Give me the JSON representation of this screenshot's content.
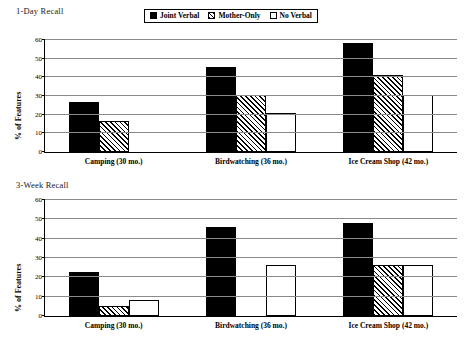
{
  "legend": {
    "items": [
      {
        "label": "Joint Verbal",
        "style": "solid",
        "icon": "solid-square-swatch-icon"
      },
      {
        "label": "Mother-Only",
        "style": "hatch",
        "icon": "hatched-square-swatch-icon"
      },
      {
        "label": "No Verbal",
        "style": "open",
        "icon": "open-square-swatch-icon"
      }
    ]
  },
  "panels": [
    {
      "title": "1-Day Recall",
      "ylabel": "% of Features",
      "yticks": [
        "0",
        "10",
        "20",
        "30",
        "40",
        "50",
        "60"
      ],
      "categories": [
        "Camping (30 mo.)",
        "Birdwatching (36 mo.)",
        "Ice Cream Shop (42 mo.)"
      ],
      "values": {
        "Joint Verbal": [
          27,
          45.5,
          58.5
        ],
        "Mother-Only": [
          16.5,
          30.5,
          41
        ],
        "No Verbal": [
          0,
          21,
          30.5
        ]
      }
    },
    {
      "title": "3-Week Recall",
      "ylabel": "% of Features",
      "yticks": [
        "0",
        "10",
        "20",
        "30",
        "40",
        "50",
        "60"
      ],
      "categories": [
        "Camping (30 mo.)",
        "Birdwatching (36 mo.)",
        "Ice Cream Shop (42 mo.)"
      ],
      "values": {
        "Joint Verbal": [
          23,
          46,
          48
        ],
        "Mother-Only": [
          5,
          0,
          26.5
        ],
        "No Verbal": [
          8.5,
          26.5,
          26.5
        ]
      }
    }
  ],
  "chart_data": [
    {
      "type": "bar",
      "title": "1-Day Recall",
      "xlabel": "",
      "ylabel": "% of Features",
      "ylim": [
        0,
        60
      ],
      "ytick_step": 10,
      "grid": true,
      "legend_position": "top-center",
      "categories": [
        "Camping (30 mo.)",
        "Birdwatching (36 mo.)",
        "Ice Cream Shop (42 mo.)"
      ],
      "series": [
        {
          "name": "Joint Verbal",
          "values": [
            27,
            45.5,
            58.5
          ]
        },
        {
          "name": "Mother-Only",
          "values": [
            16.5,
            30.5,
            41
          ]
        },
        {
          "name": "No Verbal",
          "values": [
            0,
            21,
            30.5
          ]
        }
      ]
    },
    {
      "type": "bar",
      "title": "3-Week Recall",
      "xlabel": "",
      "ylabel": "% of Features",
      "ylim": [
        0,
        60
      ],
      "ytick_step": 10,
      "grid": true,
      "legend_position": "top-center",
      "categories": [
        "Camping (30 mo.)",
        "Birdwatching (36 mo.)",
        "Ice Cream Shop (42 mo.)"
      ],
      "series": [
        {
          "name": "Joint Verbal",
          "values": [
            23,
            46,
            48
          ]
        },
        {
          "name": "Mother-Only",
          "values": [
            5,
            0,
            26.5
          ]
        },
        {
          "name": "No Verbal",
          "values": [
            8.5,
            26.5,
            26.5
          ]
        }
      ]
    }
  ],
  "colors": {
    "joint_verbal": "#000000",
    "mother_only": "#ffffff",
    "no_verbal": "#ffffff",
    "gridline": "#8a8a8a",
    "axis": "#000000",
    "background": "#ffffff"
  }
}
